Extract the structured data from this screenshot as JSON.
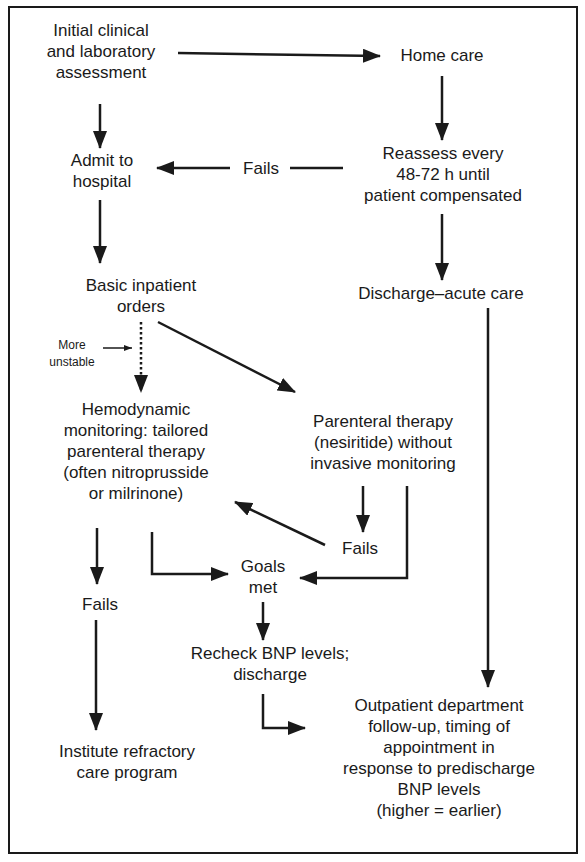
{
  "diagram": {
    "type": "flowchart",
    "nodes": {
      "initial_assessment": {
        "line1": "Initial clinical",
        "line2": "and laboratory",
        "line3": "assessment"
      },
      "home_care": {
        "line1": "Home care"
      },
      "admit_hospital": {
        "line1": "Admit to",
        "line2": "hospital"
      },
      "fails_top": {
        "line1": "Fails"
      },
      "reassess": {
        "line1": "Reassess every",
        "line2": "48-72 h until",
        "line3": "patient compensated"
      },
      "basic_orders": {
        "line1": "Basic inpatient",
        "line2": "orders"
      },
      "discharge_acute": {
        "line1": "Discharge–acute care"
      },
      "more_unstable": {
        "line1": "More",
        "line2": "unstable"
      },
      "hemodynamic": {
        "line1": "Hemodynamic",
        "line2": "monitoring: tailored",
        "line3": "parenteral therapy",
        "line4": "(often nitroprusside",
        "line5": "or milrinone)"
      },
      "parenteral_nesiritide": {
        "line1": "Parenteral therapy",
        "line2": "(nesiritide) without",
        "line3": "invasive monitoring"
      },
      "fails_middle": {
        "line1": "Fails"
      },
      "goals_met": {
        "line1": "Goals",
        "line2": "met"
      },
      "fails_left": {
        "line1": "Fails"
      },
      "recheck_bnp": {
        "line1": "Recheck BNP levels;",
        "line2": "discharge"
      },
      "refractory": {
        "line1": "Institute refractory",
        "line2": "care program"
      },
      "outpatient": {
        "line1": "Outpatient department",
        "line2": "follow-up, timing of",
        "line3": "appointment in",
        "line4": "response to predischarge",
        "line5": "BNP levels",
        "line6": "(higher = earlier)"
      }
    },
    "edges": [
      {
        "from": "initial_assessment",
        "to": "home_care"
      },
      {
        "from": "initial_assessment",
        "to": "admit_hospital"
      },
      {
        "from": "home_care",
        "to": "reassess"
      },
      {
        "from": "reassess",
        "to": "admit_hospital",
        "label": "Fails"
      },
      {
        "from": "reassess",
        "to": "discharge_acute"
      },
      {
        "from": "admit_hospital",
        "to": "basic_orders"
      },
      {
        "from": "basic_orders",
        "to": "hemodynamic",
        "style": "dotted",
        "label": "More unstable"
      },
      {
        "from": "basic_orders",
        "to": "parenteral_nesiritide"
      },
      {
        "from": "parenteral_nesiritide",
        "to": "fails_middle"
      },
      {
        "from": "fails_middle",
        "to": "hemodynamic"
      },
      {
        "from": "parenteral_nesiritide",
        "to": "goals_met"
      },
      {
        "from": "hemodynamic",
        "to": "goals_met"
      },
      {
        "from": "hemodynamic",
        "to": "fails_left"
      },
      {
        "from": "fails_left",
        "to": "refractory"
      },
      {
        "from": "goals_met",
        "to": "recheck_bnp"
      },
      {
        "from": "recheck_bnp",
        "to": "outpatient"
      },
      {
        "from": "discharge_acute",
        "to": "outpatient"
      }
    ],
    "colors": {
      "ink": "#1a1a1a",
      "background": "#ffffff"
    }
  }
}
